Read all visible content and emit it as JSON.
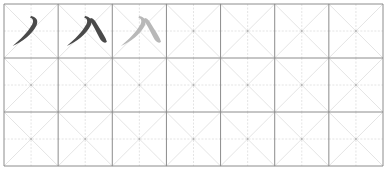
{
  "worksheet": {
    "type": "mizi-grid-practice-sheet",
    "columns": 7,
    "rows": 3,
    "grid_color": "#8c8c8c",
    "guide_color": "#dddddd",
    "character": "八",
    "cells": [
      {
        "row": 0,
        "col": 0,
        "content": "丿",
        "style": "dark",
        "description": "first stroke (pie) of 八"
      },
      {
        "row": 0,
        "col": 1,
        "content": "八",
        "style": "dark",
        "description": "complete character"
      },
      {
        "row": 0,
        "col": 2,
        "content": "八",
        "style": "light",
        "description": "tracing character"
      }
    ],
    "ink_dark": "#4a4a4a",
    "ink_light": "#b8b8b8"
  }
}
